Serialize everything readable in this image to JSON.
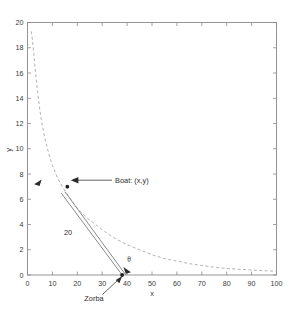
{
  "chart_data": {
    "type": "line",
    "title": "",
    "xlabel": "x",
    "ylabel": "y",
    "xlim": [
      0,
      100
    ],
    "ylim": [
      0,
      20
    ],
    "grid": false,
    "legend": "none",
    "xticks": [
      0,
      10,
      20,
      30,
      40,
      50,
      60,
      70,
      80,
      90,
      100
    ],
    "xticklabels": [
      "0",
      "10",
      "20",
      "30",
      "40",
      "50",
      "60",
      "70",
      "80",
      "90",
      "100"
    ],
    "yticks": [
      0,
      2,
      4,
      6,
      8,
      10,
      12,
      14,
      16,
      18,
      20
    ],
    "yticklabels": [
      "0",
      "2",
      "4",
      "6",
      "8",
      "10",
      "12",
      "14",
      "16",
      "18",
      "20"
    ],
    "series": [
      {
        "name": "hyperbola",
        "style": "dashed",
        "color": "#a9a9a9",
        "x": [
          1.5,
          2,
          3,
          4,
          5,
          6,
          7,
          8,
          9,
          10,
          12,
          14,
          16,
          18,
          20,
          24,
          28,
          32,
          36,
          40,
          45,
          50,
          55,
          60,
          65,
          70,
          75,
          80,
          85,
          90,
          95,
          100
        ],
        "y": [
          19.3,
          18.6,
          16.5,
          14.6,
          13.0,
          11.8,
          10.8,
          10.0,
          9.3,
          8.7,
          7.7,
          7.0,
          6.4,
          5.8,
          5.3,
          4.5,
          3.9,
          3.3,
          2.8,
          2.4,
          2.0,
          1.6,
          1.3,
          1.1,
          0.9,
          0.75,
          0.62,
          0.52,
          0.45,
          0.39,
          0.34,
          0.3
        ]
      }
    ],
    "points": [
      {
        "name": "boat",
        "x": 16,
        "y": 7.0
      },
      {
        "name": "zorba",
        "x": 38,
        "y": 0.0
      }
    ],
    "annotations": [
      {
        "name": "boat-label",
        "text": "Boat: (x,y)",
        "x": 33,
        "y": 7.2
      },
      {
        "name": "distance-label",
        "text": "20",
        "x": 19.5,
        "y": 3.0
      },
      {
        "name": "angle-label",
        "text": "θ",
        "x": 40.5,
        "y": 1.2
      },
      {
        "name": "zorba-label",
        "text": "Zorba",
        "x": 27,
        "y": -2.3
      }
    ],
    "segments": [
      {
        "name": "rope-upper",
        "x1": 38,
        "y1": 0.0,
        "x2": 13.5,
        "y2": 6.5
      },
      {
        "name": "rope-lower",
        "x1": 39.5,
        "y1": 0.0,
        "x2": 15.0,
        "y2": 6.6
      }
    ]
  },
  "axes": {
    "xlabel": "x",
    "ylabel": "y"
  },
  "labels": {
    "boat": "Boat: (x,y)",
    "distance": "20",
    "theta": "θ",
    "zorba": "Zorba"
  },
  "ticks": {
    "x": [
      "0",
      "10",
      "20",
      "30",
      "40",
      "50",
      "60",
      "70",
      "80",
      "90",
      "100"
    ],
    "y": [
      "0",
      "2",
      "4",
      "6",
      "8",
      "10",
      "12",
      "14",
      "16",
      "18",
      "20"
    ]
  },
  "colors": {
    "axis": "#8a8a8a",
    "curve": "#a9a9a9",
    "segment": "#7d7d7d",
    "text": "#3a3a3a",
    "marker": "#1f1f1f",
    "background": "#ffffff"
  }
}
